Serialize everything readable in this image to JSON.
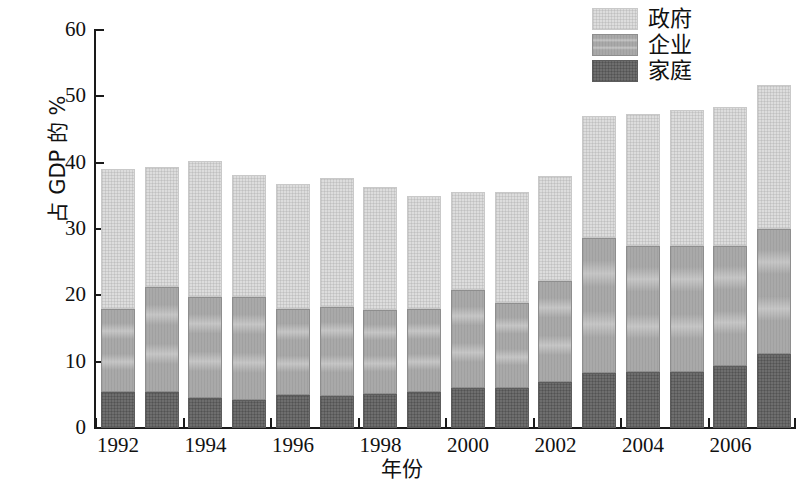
{
  "chart_data": {
    "type": "bar",
    "subtype": "stacked",
    "title": "",
    "xlabel": "年份",
    "ylabel": "占 GDP 的 %",
    "ylim": [
      0,
      60
    ],
    "yticks": [
      0,
      10,
      20,
      30,
      40,
      50,
      60
    ],
    "ytick_labels": [
      "0",
      "10",
      "20",
      "30",
      "40",
      "50",
      "60"
    ],
    "grid": false,
    "legend_position": "top-right",
    "x": [
      1992,
      1993,
      1994,
      1995,
      1996,
      1997,
      1998,
      1999,
      2000,
      2001,
      2002,
      2003,
      2004,
      2005,
      2006,
      2007
    ],
    "categories": [
      "1992",
      "1993",
      "1994",
      "1995",
      "1996",
      "1997",
      "1998",
      "1999",
      "2000",
      "2001",
      "2002",
      "2003",
      "2004",
      "2005",
      "2006",
      "2007"
    ],
    "xtick_labels": [
      "1992",
      "1994",
      "1996",
      "1998",
      "2000",
      "2002",
      "2004",
      "2006"
    ],
    "xtick_values": [
      1992,
      1994,
      1996,
      1998,
      2000,
      2002,
      2004,
      2006
    ],
    "series": [
      {
        "name": "家庭",
        "color": "#6e6e6e",
        "values": [
          5.4,
          5.5,
          4.5,
          4.2,
          5.0,
          4.8,
          5.2,
          5.4,
          6.0,
          6.0,
          6.9,
          8.3,
          8.5,
          8.5,
          9.3,
          11.1
        ]
      },
      {
        "name": "企业",
        "color": "#a9a9a9",
        "values": [
          12.5,
          15.8,
          15.2,
          15.5,
          13.0,
          13.4,
          12.6,
          12.6,
          14.8,
          12.9,
          15.2,
          20.4,
          19.0,
          19.0,
          18.2,
          18.9
        ]
      },
      {
        "name": "政府",
        "color": "#dddddd",
        "values": [
          21.2,
          18.1,
          20.5,
          18.5,
          18.8,
          19.5,
          18.6,
          17.0,
          14.8,
          16.7,
          15.9,
          18.4,
          19.8,
          20.4,
          20.9,
          21.7
        ]
      }
    ],
    "totals": [
      39.1,
      39.4,
      40.2,
      38.2,
      36.8,
      37.7,
      36.4,
      35.0,
      35.6,
      35.6,
      38.0,
      47.1,
      47.3,
      47.9,
      48.4,
      51.7
    ],
    "segment_tops": {
      "household": [
        5.4,
        5.5,
        4.5,
        4.2,
        5.0,
        4.8,
        5.2,
        5.4,
        6.0,
        6.0,
        6.9,
        8.3,
        8.5,
        8.5,
        9.3,
        11.1
      ],
      "household_plus_enterprise": [
        17.9,
        21.3,
        19.7,
        19.7,
        18.0,
        18.2,
        17.8,
        18.0,
        20.8,
        18.9,
        22.1,
        28.7,
        27.5,
        27.5,
        27.5,
        30.0
      ]
    }
  },
  "legend": {
    "items": [
      {
        "label": "政府",
        "color": "#dddddd",
        "swatch_name": "legend-swatch-government"
      },
      {
        "label": "企业",
        "color": "#a9a9a9",
        "swatch_name": "legend-swatch-enterprise"
      },
      {
        "label": "家庭",
        "color": "#6e6e6e",
        "swatch_name": "legend-swatch-household"
      }
    ]
  },
  "axes": {
    "y_title": "占 GDP 的 %",
    "x_title": "年份"
  }
}
